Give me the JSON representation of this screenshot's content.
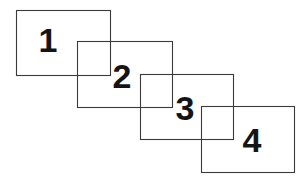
{
  "diagram": {
    "background_color": "#ffffff",
    "stroke_color": "#3b3b3b",
    "label_color": "#141414",
    "canvas": {
      "width": 307,
      "height": 182
    },
    "shapes": [
      {
        "id": "rect-1",
        "label": "1",
        "x": 16,
        "y": 10,
        "width": 94,
        "height": 65,
        "label_x": 48,
        "label_y": 52
      },
      {
        "id": "rect-2",
        "label": "2",
        "x": 77,
        "y": 41,
        "width": 95,
        "height": 66,
        "label_x": 122,
        "label_y": 88
      },
      {
        "id": "rect-3",
        "label": "3",
        "x": 140,
        "y": 74,
        "width": 93,
        "height": 65,
        "label_x": 185,
        "label_y": 120
      },
      {
        "id": "rect-4",
        "label": "4",
        "x": 201,
        "y": 106,
        "width": 93,
        "height": 66,
        "label_x": 252,
        "label_y": 152
      }
    ]
  }
}
